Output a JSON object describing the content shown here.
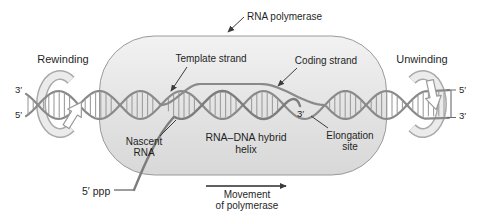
{
  "figure": {
    "labels": {
      "rna_polymerase": "RNA polymerase",
      "rewinding": "Rewinding",
      "unwinding": "Unwinding",
      "template_strand": "Template strand",
      "coding_strand": "Coding strand",
      "nascent_rna_line1": "Nascent",
      "nascent_rna_line2": "RNA",
      "hybrid_helix_line1": "RNA–DNA hybrid",
      "hybrid_helix_line2": "helix",
      "elongation_site_line1": "Elongation",
      "elongation_site_line2": "site",
      "five_prime_ppp": "5′ ppp",
      "movement_line1": "Movement",
      "movement_line2": "of polymerase",
      "rna_three_prime_end": "3′",
      "dna_left_top_end": "3′",
      "dna_left_bottom_end": "5′",
      "dna_right_top_end": "5′",
      "dna_right_bottom_end": "3′"
    },
    "colors": {
      "background": "#ffffff",
      "capsule_fill_top": "#f2f2f2",
      "capsule_fill_mid": "#e4e4e4",
      "capsule_fill_bottom": "#d8d8d8",
      "capsule_border": "#9a9a9a",
      "dna_strand": "#8a8a8a",
      "base_pair_rung": "#9d9d9d",
      "rna_strand": "#7d7d7d",
      "ribbon_edge": "#a9a9a9",
      "ribbon_fill": "#ebebeb",
      "hollow_arrow_fill": "#ffffff",
      "hollow_arrow_edge": "#9a9a9a",
      "leader_line": "#3c3c3c",
      "end_bar": "#6a6a6a",
      "movement_arrow": "#2b2b2b",
      "text": "#1f1f1f"
    }
  }
}
